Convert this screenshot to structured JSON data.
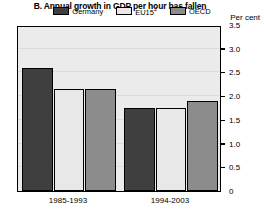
{
  "chart_data": {
    "type": "bar",
    "title": "B. Annual growth in GDP per hour has fallen",
    "xlabel": "",
    "ylabel": "Per cent",
    "ylim": [
      0,
      3.5
    ],
    "yticks": [
      "0",
      "0.5",
      "1.0",
      "1.5",
      "2.0",
      "2.5",
      "3.0",
      "3.5"
    ],
    "ytick_values": [
      0,
      0.5,
      1.0,
      1.5,
      2.0,
      2.5,
      3.0,
      3.5
    ],
    "grid": true,
    "legend_position": "top-center",
    "categories": [
      "1985-1993",
      "1994-2003"
    ],
    "series": [
      {
        "name": "Germany",
        "label": "Germany",
        "color": "#3f3f3f",
        "values": [
          2.6,
          1.75
        ]
      },
      {
        "name": "EU15",
        "label": "EU15",
        "superscript": "2",
        "color": "#e8e8e8",
        "values": [
          2.15,
          1.75
        ]
      },
      {
        "name": "OECD",
        "label": "OECD",
        "color": "#8c8c8c",
        "values": [
          2.15,
          1.9
        ]
      }
    ]
  },
  "colors": {
    "germany": "#3f3f3f",
    "eu15": "#e8e8e8",
    "oecd": "#8c8c8c",
    "plot_background": "#ebebeb",
    "gridline": "#dcdcdc",
    "axis": "#000000"
  }
}
